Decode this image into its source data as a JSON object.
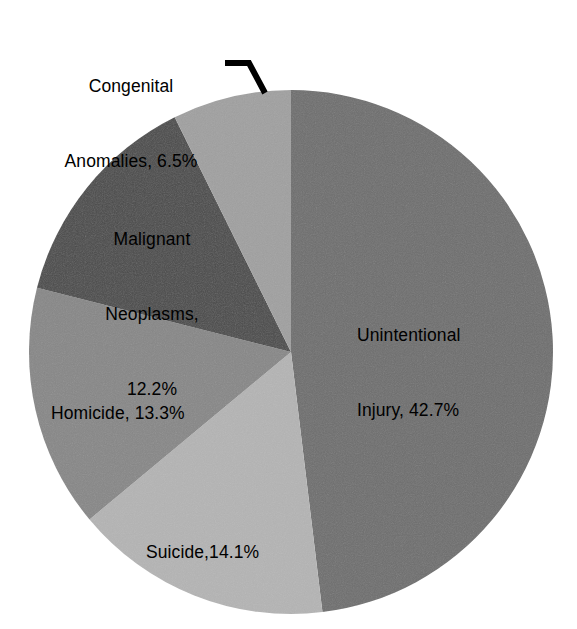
{
  "chart_data": {
    "type": "pie",
    "title": "",
    "subtitle": "",
    "legend_position": "none",
    "grid": false,
    "start_angle_deg": 0,
    "direction": "clockwise",
    "categories": [
      "Unintentional Injury",
      "Suicide",
      "Homicide",
      "Malignant Neoplasms",
      "Congenital Anomalies"
    ],
    "values": [
      42.7,
      14.1,
      13.3,
      12.2,
      6.5
    ],
    "value_unit": "%",
    "slices": [
      {
        "name": "Unintentional Injury",
        "value": 42.7,
        "value_text": "42.7%",
        "label_text": "Unintentional\nInjury, 42.7%",
        "label_lines": [
          "Unintentional",
          "Injury, 42.7%"
        ],
        "color": "#6e6e6e",
        "label_placement": "inside",
        "leader_line": false
      },
      {
        "name": "Suicide",
        "value": 14.1,
        "value_text": "14.1%",
        "label_text": "Suicide,14.1%",
        "label_lines": [
          "Suicide,14.1%"
        ],
        "color": "#b4b4b4",
        "label_placement": "inside",
        "leader_line": false
      },
      {
        "name": "Homicide",
        "value": 13.3,
        "value_text": "13.3%",
        "label_text": "Homicide, 13.3%",
        "label_lines": [
          "Homicide, 13.3%"
        ],
        "color": "#878787",
        "label_placement": "inside",
        "leader_line": false
      },
      {
        "name": "Malignant Neoplasms",
        "value": 12.2,
        "value_text": "12.2%",
        "label_text": "Malignant\nNeoplasms,\n12.2%",
        "label_lines": [
          "Malignant",
          "Neoplasms,",
          "12.2%"
        ],
        "color": "#4a4a4a",
        "label_placement": "inside",
        "leader_line": false
      },
      {
        "name": "Congenital Anomalies",
        "value": 6.5,
        "value_text": "6.5%",
        "label_text": "Congenital\nAnomalies, 6.5%",
        "label_lines": [
          "Congenital",
          "Anomalies, 6.5%"
        ],
        "color": "#a0a0a0",
        "label_placement": "outside",
        "leader_line": true
      }
    ],
    "geometry": {
      "center_x": 291,
      "center_y": 352,
      "radius": 262
    },
    "colors": {
      "unintentional_injury": "#6e6e6e",
      "suicide": "#b4b4b4",
      "homicide": "#878787",
      "malignant_neoplasms": "#4a4a4a",
      "congenital_anomalies": "#a0a0a0",
      "label_text": "#000000",
      "leader_line": "#000000",
      "background": "#ffffff"
    }
  }
}
